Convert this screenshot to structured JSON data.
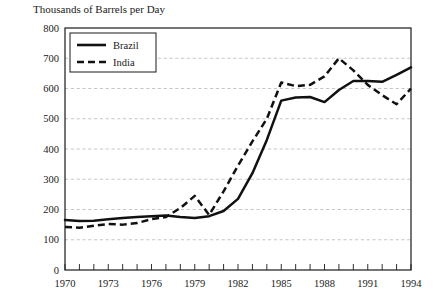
{
  "chart_data": {
    "type": "line",
    "title": "Thousands of Barrels per Day",
    "xlabel": "",
    "ylabel": "",
    "ylim": [
      0,
      800
    ],
    "xlim": [
      1970,
      1994
    ],
    "ytick_step": 100,
    "xtick_step": 1,
    "xlabel_step": 3,
    "grid": true,
    "legend_position": "top-left",
    "yticks": [
      "0",
      "100",
      "200",
      "300",
      "400",
      "500",
      "600",
      "700",
      "800"
    ],
    "xticks": [
      "1970",
      "1971",
      "1972",
      "1973",
      "1974",
      "1975",
      "1976",
      "1977",
      "1978",
      "1979",
      "1980",
      "1981",
      "1982",
      "1983",
      "1984",
      "1985",
      "1986",
      "1987",
      "1988",
      "1989",
      "1990",
      "1991",
      "1992",
      "1993",
      "1994"
    ],
    "xticks_labeled": [
      "1970",
      "1973",
      "1976",
      "1979",
      "1982",
      "1985",
      "1988",
      "1991",
      "1994"
    ],
    "x": [
      1970,
      1971,
      1972,
      1973,
      1974,
      1975,
      1976,
      1977,
      1978,
      1979,
      1980,
      1981,
      1982,
      1983,
      1984,
      1985,
      1986,
      1987,
      1988,
      1989,
      1990,
      1991,
      1992,
      1993,
      1994
    ],
    "series": [
      {
        "name": "Brazil",
        "style": "solid",
        "color": "#111111",
        "values": [
          165,
          162,
          163,
          168,
          172,
          175,
          178,
          180,
          175,
          172,
          178,
          195,
          235,
          320,
          430,
          560,
          570,
          572,
          555,
          595,
          625,
          625,
          622,
          645,
          670
        ]
      },
      {
        "name": "India",
        "style": "dashed",
        "color": "#111111",
        "values": [
          142,
          140,
          146,
          152,
          150,
          155,
          168,
          175,
          205,
          245,
          182,
          260,
          345,
          425,
          500,
          620,
          608,
          612,
          640,
          700,
          660,
          612,
          578,
          548,
          600
        ]
      }
    ]
  },
  "legend": {
    "items": [
      {
        "label": "Brazil",
        "style": "solid"
      },
      {
        "label": "India",
        "style": "dashed"
      }
    ]
  }
}
